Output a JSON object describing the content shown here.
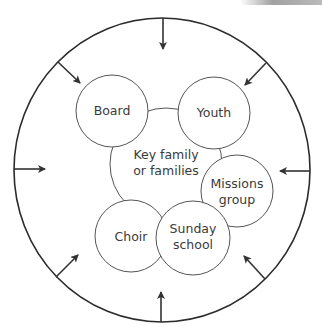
{
  "diagram": {
    "title": "",
    "center": {
      "label_line1": "Key family",
      "label_line2": "or families"
    },
    "groups": [
      {
        "id": "board",
        "line1": "Board",
        "line2": ""
      },
      {
        "id": "youth",
        "line1": "Youth",
        "line2": ""
      },
      {
        "id": "missions",
        "line1": "Missions",
        "line2": "group"
      },
      {
        "id": "sunday-school",
        "line1": "Sunday",
        "line2": "school"
      },
      {
        "id": "choir",
        "line1": "Choir",
        "line2": ""
      }
    ],
    "outer_boundary": "circle with eight inward-pointing arrows",
    "arrow_count": 8,
    "colors": {
      "line": "#2b2b2b",
      "circle_stroke": "#555555",
      "text": "#3a3a3a",
      "background": "#ffffff"
    }
  }
}
